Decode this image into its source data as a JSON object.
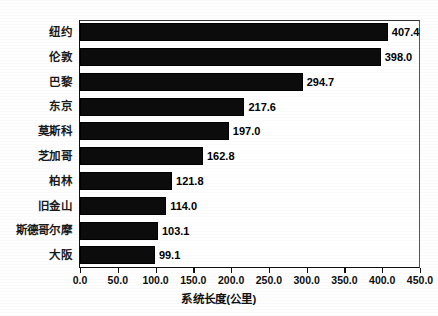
{
  "chart_data": {
    "type": "bar",
    "orientation": "horizontal",
    "title": "",
    "xlabel": "系统长度(公里)",
    "ylabel": "",
    "categories": [
      "纽约",
      "伦敦",
      "巴黎",
      "东京",
      "莫斯科",
      "芝加哥",
      "柏林",
      "旧金山",
      "斯德哥尔摩",
      "大阪"
    ],
    "values": [
      407.4,
      398.0,
      294.7,
      217.6,
      197.0,
      162.8,
      121.8,
      114.0,
      103.1,
      99.1
    ],
    "data_labels": [
      "407.4",
      "398.0",
      "294.7",
      "217.6",
      "197.0",
      "162.8",
      "121.8",
      "114.0",
      "103.1",
      "99.1"
    ],
    "xlim": [
      0,
      450
    ],
    "xticks": [
      0,
      50,
      100,
      150,
      200,
      250,
      300,
      350,
      400,
      450
    ],
    "xticklabels": [
      "0.0",
      "50.0",
      "100.0",
      "150.0",
      "200.0",
      "250.0",
      "300.0",
      "350.0",
      "400.0",
      "450.0"
    ],
    "grid": false,
    "legend": null,
    "bar_color": "#0c0c0c",
    "background_color": "#ffffff",
    "axis_color": "#111111"
  }
}
